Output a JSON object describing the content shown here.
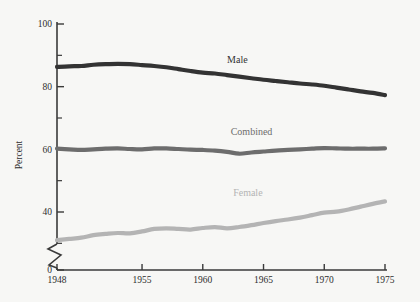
{
  "chart_data": {
    "type": "line",
    "title": "",
    "subtitle": "",
    "xlabel": "",
    "ylabel": "Percent",
    "xlim": [
      1948,
      1975
    ],
    "ylim": [
      0,
      100
    ],
    "y_axis_break": true,
    "y_break_note": "axis broken between 0 and ~28",
    "grid": false,
    "legend_position": "inline-labels",
    "x_ticks": [
      1948,
      1955,
      1960,
      1965,
      1970,
      1975
    ],
    "x_tick_labels": [
      "1948",
      "1955",
      "1960",
      "1965",
      "1970",
      "1975"
    ],
    "y_ticks": [
      0,
      40,
      60,
      80,
      100
    ],
    "y_tick_labels": [
      "0",
      "40",
      "60",
      "80",
      "100"
    ],
    "y_minor_ticks": [
      30,
      50,
      70,
      90
    ],
    "x": [
      1948,
      1949,
      1950,
      1951,
      1952,
      1953,
      1954,
      1955,
      1956,
      1957,
      1958,
      1959,
      1960,
      1961,
      1962,
      1963,
      1964,
      1965,
      1966,
      1967,
      1968,
      1969,
      1970,
      1971,
      1972,
      1973,
      1974,
      1975
    ],
    "series": [
      {
        "name": "Male",
        "color": "#333333",
        "label": "Male",
        "label_x": 1962.0,
        "label_y": 87.5,
        "values": [
          86.3,
          86.5,
          86.6,
          87.0,
          87.2,
          87.3,
          87.2,
          86.9,
          86.6,
          86.2,
          85.6,
          85.0,
          84.5,
          84.2,
          83.7,
          83.2,
          82.7,
          82.2,
          81.8,
          81.4,
          81.0,
          80.7,
          80.3,
          79.7,
          79.1,
          78.5,
          78.0,
          77.3
        ]
      },
      {
        "name": "Combined",
        "color": "#6d6d6d",
        "label": "Combined",
        "label_x": 1962.3,
        "label_y": 64.5,
        "values": [
          60.2,
          60.0,
          59.8,
          60.0,
          60.2,
          60.3,
          60.1,
          60.0,
          60.3,
          60.3,
          60.1,
          59.9,
          59.8,
          59.6,
          59.2,
          58.6,
          59.0,
          59.3,
          59.6,
          59.8,
          60.0,
          60.2,
          60.4,
          60.3,
          60.2,
          60.2,
          60.2,
          60.3
        ]
      },
      {
        "name": "Female",
        "color": "#b4b4b4",
        "label": "Female",
        "label_x": 1962.5,
        "label_y": 45.0,
        "values": [
          31.0,
          31.4,
          31.8,
          32.6,
          33.0,
          33.3,
          33.2,
          33.8,
          34.6,
          34.8,
          34.6,
          34.4,
          34.9,
          35.2,
          34.8,
          35.2,
          35.8,
          36.5,
          37.1,
          37.6,
          38.2,
          39.0,
          39.8,
          40.1,
          40.8,
          41.7,
          42.6,
          43.4
        ]
      }
    ]
  },
  "style": {
    "background": "#f7f7f5",
    "axis_color": "#3a3a3a",
    "text_color": "#2e2e2e"
  }
}
